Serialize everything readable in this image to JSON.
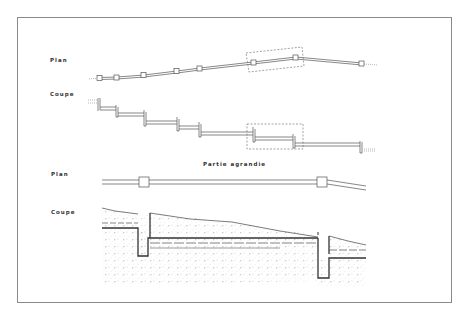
{
  "diagram": {
    "labels": {
      "plan_top": "Plan",
      "coupe_top": "Coupe",
      "partie_agrandie": "Partie agrandie",
      "plan_bottom": "Plan",
      "coupe_bottom": "Coupe"
    },
    "colors": {
      "line": "#555555",
      "frame": "#8a8a8a",
      "soil": "#9a9a9a",
      "dashed": "#666666"
    }
  }
}
